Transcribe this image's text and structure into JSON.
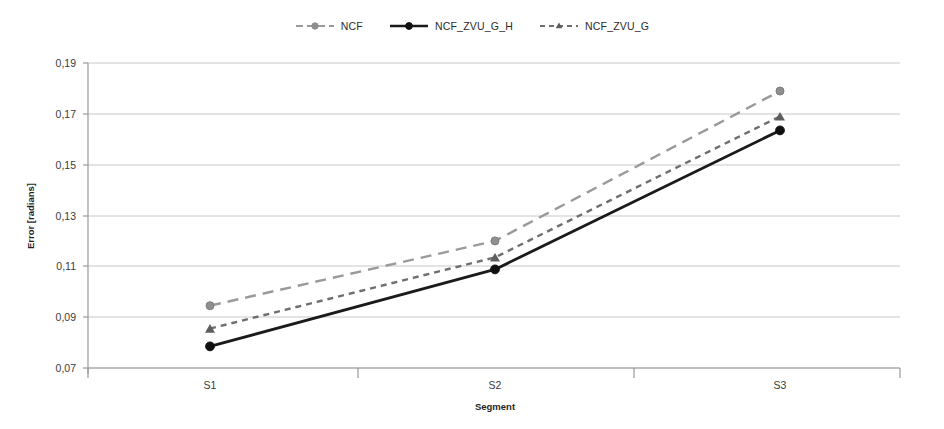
{
  "legend": {
    "position": "top-center",
    "items": [
      {
        "label": "NCF",
        "color": "#9a9a9a",
        "dash": "long-dash",
        "marker": "circle",
        "icon": "legend-line-icon"
      },
      {
        "label": "NCF_ZVU_G_H",
        "color": "#1a1a1a",
        "dash": "solid",
        "marker": "circle",
        "icon": "legend-line-icon"
      },
      {
        "label": "NCF_ZVU_G",
        "color": "#6e6e6e",
        "dash": "dash",
        "marker": "triangle",
        "icon": "legend-line-icon"
      }
    ]
  },
  "axes": {
    "y_title": "Error [radians]",
    "x_title": "Segment",
    "y_ticks": [
      "0,07",
      "0,09",
      "0,11",
      "0,13",
      "0,15",
      "0,17",
      "0,19"
    ],
    "x_ticks": [
      "S1",
      "S2",
      "S3"
    ]
  },
  "chart_data": {
    "type": "line",
    "title": "",
    "subtitle": "",
    "xlabel": "Segment",
    "ylabel": "Error [radians]",
    "categories": [
      "S1",
      "S2",
      "S3"
    ],
    "ylim": [
      0.07,
      0.19
    ],
    "ytick_step": 0.02,
    "ytick_values": [
      0.07,
      0.09,
      0.11,
      0.13,
      0.15,
      0.17,
      0.19
    ],
    "grid": "horizontal",
    "legend_position": "top-center",
    "series": [
      {
        "name": "NCF",
        "values": [
          0.0945,
          0.12,
          0.179
        ],
        "color": "#9a9a9a",
        "dash": "long-dash",
        "marker": "circle"
      },
      {
        "name": "NCF_ZVU_G_H",
        "values": [
          0.0785,
          0.1088,
          0.1635
        ],
        "color": "#1a1a1a",
        "dash": "solid",
        "marker": "circle"
      },
      {
        "name": "NCF_ZVU_G",
        "values": [
          0.0855,
          0.1135,
          0.169
        ],
        "color": "#6e6e6e",
        "dash": "dash",
        "marker": "triangle"
      }
    ]
  },
  "style": {
    "grid_color": "#c8c8c8",
    "axis_color": "#8a8a8a",
    "background": "#ffffff"
  }
}
